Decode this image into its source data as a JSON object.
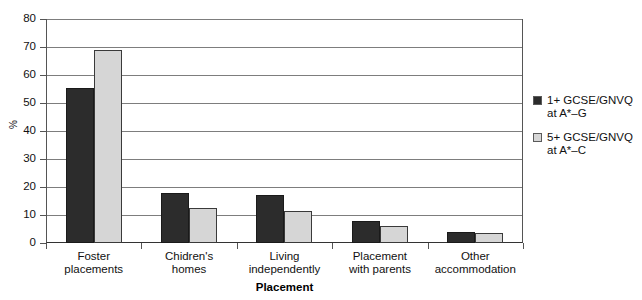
{
  "chart_data": {
    "type": "bar",
    "title": "",
    "subtitle": "",
    "xlabel": "Placement",
    "ylabel": "%",
    "ylim": [
      0,
      80
    ],
    "yticks": [
      0,
      10,
      20,
      30,
      40,
      50,
      60,
      70,
      80
    ],
    "ytick_labels": [
      "0",
      "10",
      "20",
      "30",
      "40",
      "50",
      "60",
      "70",
      "80"
    ],
    "grid": true,
    "legend_position": "right",
    "categories": [
      "Foster placements",
      "Chidren's homes",
      "Living independently",
      "Placement with parents",
      "Other accommodation"
    ],
    "category_lines": [
      [
        "Foster",
        "placements"
      ],
      [
        "Chidren's",
        "homes"
      ],
      [
        "Living",
        "independently"
      ],
      [
        "Placement",
        "with parents"
      ],
      [
        "Other",
        "accommodation"
      ]
    ],
    "series": [
      {
        "name": "1+ GCSE/GNVQ at A*–G",
        "name_lines": [
          "1+ GCSE/GNVQ",
          "at A*–G"
        ],
        "color": "#2c2c2c",
        "values": [
          55.5,
          18,
          17,
          8,
          4
        ]
      },
      {
        "name": "5+ GCSE/GNVQ at A*–C",
        "name_lines": [
          "5+ GCSE/GNVQ",
          "at A*–C"
        ],
        "color": "#d6d6d6",
        "values": [
          69,
          12.5,
          11.5,
          6,
          3.5
        ]
      }
    ]
  },
  "legend": {
    "entries": [
      {
        "line1": "1+ GCSE/GNVQ",
        "line2": "at A*–G"
      },
      {
        "line1": "5+ GCSE/GNVQ",
        "line2": "at A*–C"
      }
    ]
  },
  "axes": {
    "x_title": "Placement",
    "y_title": "%"
  }
}
